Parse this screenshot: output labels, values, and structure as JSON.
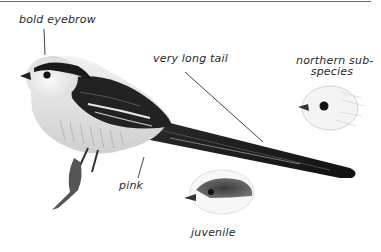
{
  "illustration": {
    "subject": "long-tailed tit",
    "labels": {
      "bold_eyebrow": "bold eyebrow",
      "very_long_tail": "very long tail",
      "northern_subspecies_line1": "northern sub-",
      "northern_subspecies_line2": "species",
      "pink": "pink",
      "juvenile": "juvenile"
    },
    "figures": [
      "adult-bird",
      "northern-subspecies-head",
      "juvenile-head"
    ]
  },
  "colors": {
    "ink": "#2a2a2a",
    "rule": "#6a6a6a",
    "plumage_dark": "#1e1e1e",
    "plumage_mid": "#7a7a7a",
    "plumage_light": "#e6e6e6"
  }
}
